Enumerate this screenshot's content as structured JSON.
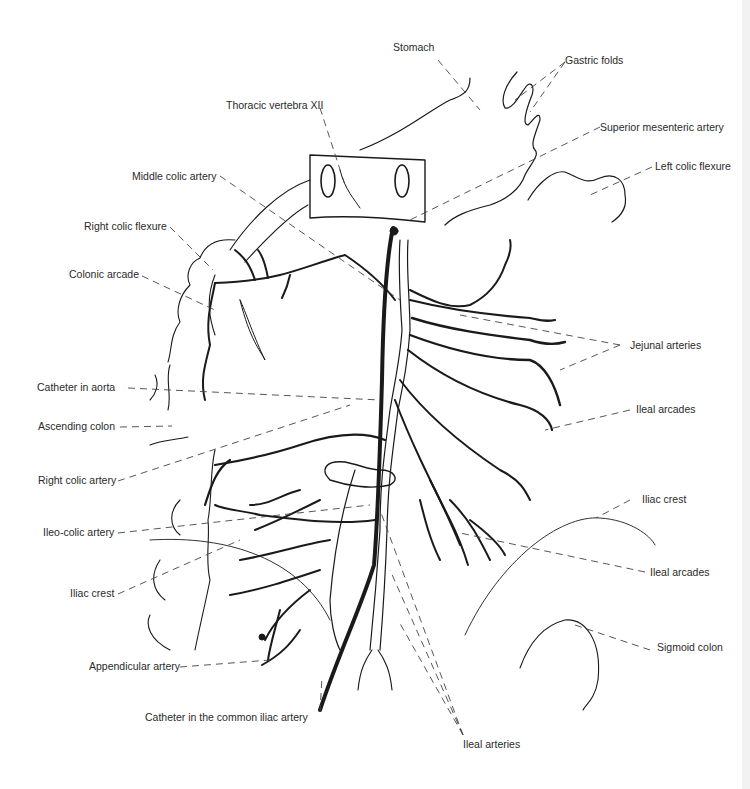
{
  "diagram": {
    "title": "",
    "colors": {
      "line": "#1a1a1a",
      "text": "#2a2a2a",
      "leader": "#444444",
      "background": "#ffffff"
    },
    "labels": [
      {
        "id": "stomach",
        "text": "Stomach",
        "x": 393,
        "y": 47
      },
      {
        "id": "gastric-folds",
        "text": "Gastric folds",
        "x": 565,
        "y": 55
      },
      {
        "id": "thoracic-vertebra",
        "text": "Thoracic vertebra XII",
        "x": 226,
        "y": 100
      },
      {
        "id": "superior-mesenteric-artery",
        "text": "Superior mesenteric artery",
        "x": 600,
        "y": 122
      },
      {
        "id": "middle-colic-artery",
        "text": "Middle colic artery",
        "x": 132,
        "y": 171
      },
      {
        "id": "left-colic-flexure",
        "text": "Left colic flexure",
        "x": 655,
        "y": 161
      },
      {
        "id": "right-colic-flexure",
        "text": "Right colic flexure",
        "x": 84,
        "y": 221
      },
      {
        "id": "colonic-arcade",
        "text": "Colonic arcade",
        "x": 69,
        "y": 269
      },
      {
        "id": "jejunal-arteries",
        "text": "Jejunal arteries",
        "x": 630,
        "y": 340
      },
      {
        "id": "catheter-in-aorta",
        "text": "Catheter in aorta",
        "x": 37,
        "y": 382
      },
      {
        "id": "ileal-arcades-upper",
        "text": "Ileal arcades",
        "x": 636,
        "y": 404
      },
      {
        "id": "ascending-colon",
        "text": "Ascending colon",
        "x": 38,
        "y": 421
      },
      {
        "id": "right-colic-artery",
        "text": "Right colic artery",
        "x": 38,
        "y": 475
      },
      {
        "id": "iliac-crest-right",
        "text": "Iliac crest",
        "x": 642,
        "y": 494
      },
      {
        "id": "ileo-colic-artery",
        "text": "Ileo-colic artery",
        "x": 43,
        "y": 527
      },
      {
        "id": "ileal-arcades-lower",
        "text": "Ileal arcades",
        "x": 650,
        "y": 567
      },
      {
        "id": "iliac-crest-left",
        "text": "Iliac crest",
        "x": 70,
        "y": 588
      },
      {
        "id": "sigmoid-colon",
        "text": "Sigmoid colon",
        "x": 657,
        "y": 642
      },
      {
        "id": "appendicular-artery",
        "text": "Appendicular artery",
        "x": 89,
        "y": 661
      },
      {
        "id": "catheter-common-iliac",
        "text": "Catheter in the common iliac artery",
        "x": 145,
        "y": 711
      },
      {
        "id": "ileal-arteries",
        "text": "Ileal arteries",
        "x": 463,
        "y": 738
      }
    ]
  }
}
